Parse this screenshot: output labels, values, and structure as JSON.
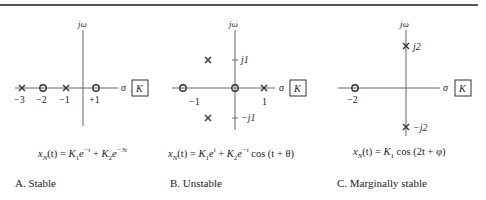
{
  "figure": {
    "axis_labels": {
      "imag": "jω",
      "real": "σ",
      "gain_box": "K"
    },
    "panels": [
      {
        "id": "A",
        "caption": "A.  Stable",
        "formula_text": "x_N(t) = K_1 e^{-t} + K_2 e^{-3t}",
        "formula": {
          "lhs": "x",
          "lhs_sub": "N",
          "lhs_arg": "(t) = ",
          "t1": "K",
          "t1_sub": "1",
          "t1_e": "e",
          "t1_sup": "−t",
          "plus": " + ",
          "t2": "K",
          "t2_sub": "2",
          "t2_e": "e",
          "t2_sup": "−3t",
          "tail": ""
        },
        "poles": [
          {
            "re": -3,
            "im": 0
          },
          {
            "re": -1,
            "im": 0
          }
        ],
        "zeros": [
          {
            "re": -2,
            "im": 0
          },
          {
            "re": 1,
            "im": 0
          }
        ],
        "real_ticks": [
          "−3",
          "−2",
          "−1",
          "+1"
        ],
        "imag_ticks": []
      },
      {
        "id": "B",
        "caption": "B.  Unstable",
        "formula_text": "x_N(t) = K_1 e^{t} + K_2 e^{-t} cos (t + θ)",
        "formula": {
          "lhs": "x",
          "lhs_sub": "N",
          "lhs_arg": "(t) = ",
          "t1": "K",
          "t1_sub": "1",
          "t1_e": "e",
          "t1_sup": "t",
          "plus": " + ",
          "t2": "K",
          "t2_sub": "2",
          "t2_e": "e",
          "t2_sup": "−t",
          "tail": " cos (t + θ)"
        },
        "poles": [
          {
            "re": 1,
            "im": 0
          },
          {
            "re": -0.5,
            "im": 1
          },
          {
            "re": -0.5,
            "im": -1
          }
        ],
        "zeros": [
          {
            "re": -1,
            "im": 0
          },
          {
            "re": 0,
            "im": 0
          }
        ],
        "real_ticks": [
          "−1",
          "1"
        ],
        "imag_ticks": [
          "j1",
          "−j1"
        ]
      },
      {
        "id": "C",
        "caption": "C.  Marginally stable",
        "formula_text": "x_N(t) = K_1 cos (2t + φ)",
        "formula": {
          "lhs": "x",
          "lhs_sub": "N",
          "lhs_arg": "(t) = ",
          "t1": "K",
          "t1_sub": "1",
          "tail": " cos (2t + φ)"
        },
        "poles": [
          {
            "re": 0,
            "im": 2
          },
          {
            "re": 0,
            "im": -2
          }
        ],
        "zeros": [
          {
            "re": -2,
            "im": 0
          }
        ],
        "real_ticks": [
          "−2"
        ],
        "imag_ticks": [
          "j2",
          "−j2"
        ]
      }
    ]
  }
}
